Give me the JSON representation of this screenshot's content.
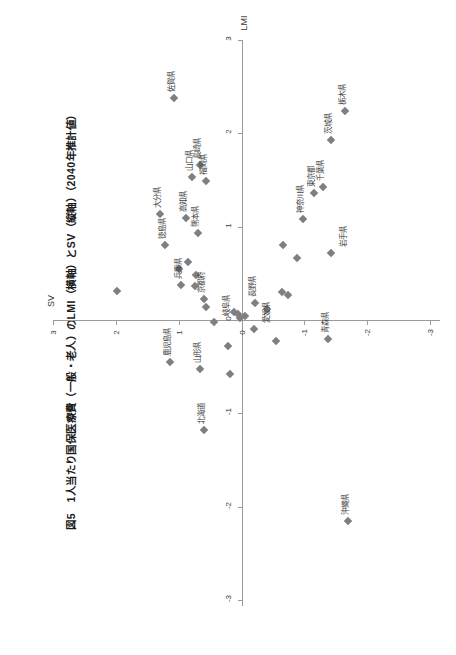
{
  "figure": {
    "title": "図5　1人当たり国保医療費（一般・老人）のLMI（横軸）とSV（縦軸）（2040年推計値）"
  },
  "chart_data": {
    "type": "scatter",
    "title": "図5　1人当たり国保医療費（一般・老人）のLMI（横軸）とSV（縦軸）（2040年推計値）",
    "xlabel": "LMI",
    "ylabel": "SV",
    "xlim": [
      -3,
      3
    ],
    "ylim": [
      -3,
      3
    ],
    "xticks": [
      3,
      2,
      1,
      0,
      -1,
      -2,
      -3
    ],
    "yticks": [
      3,
      2,
      1,
      0,
      -1,
      -2,
      -3
    ],
    "xtick_labels": [
      "3",
      "2",
      "1",
      "0",
      "-1",
      "-2",
      "-3"
    ],
    "ytick_labels": [
      "3",
      "2",
      "1",
      "0",
      "-1",
      "-2",
      "-3"
    ],
    "grid": false,
    "legend": "none",
    "marker": "diamond",
    "marker_color": "#7f7f7f",
    "points": [
      {
        "label": "佐賀県",
        "lmi": 2.38,
        "sv": 1.07,
        "label_pos": "above"
      },
      {
        "label": "栃木県",
        "lmi": 2.24,
        "sv": -1.65,
        "label_pos": "above"
      },
      {
        "label": "茨城県",
        "lmi": 1.93,
        "sv": -1.42,
        "label_pos": "above"
      },
      {
        "label": "長崎県",
        "lmi": 1.66,
        "sv": 0.66,
        "label_pos": "above"
      },
      {
        "label": "山口県",
        "lmi": 1.53,
        "sv": 0.78,
        "label_pos": "above"
      },
      {
        "label": "福岡県",
        "lmi": 1.49,
        "sv": 0.56,
        "label_pos": "above"
      },
      {
        "label": "千葉県",
        "lmi": 1.42,
        "sv": -1.3,
        "label_pos": "above"
      },
      {
        "label": "東京都",
        "lmi": 1.36,
        "sv": -1.16,
        "label_pos": "above"
      },
      {
        "label": "大分県",
        "lmi": 1.14,
        "sv": 1.3,
        "label_pos": "above"
      },
      {
        "label": "高知県",
        "lmi": 1.09,
        "sv": 0.88,
        "label_pos": "above"
      },
      {
        "label": "神奈川県",
        "lmi": 1.08,
        "sv": -0.98,
        "label_pos": "above"
      },
      {
        "label": "熊本県",
        "lmi": 0.93,
        "sv": 0.69,
        "label_pos": "above"
      },
      {
        "label": "徳島県",
        "lmi": 0.8,
        "sv": 1.21,
        "label_pos": "above"
      },
      {
        "label": "岩手県",
        "lmi": 0.72,
        "sv": -1.43,
        "label_pos": "below"
      },
      {
        "label": "",
        "lmi": 0.8,
        "sv": -0.66
      },
      {
        "label": "",
        "lmi": 0.66,
        "sv": -0.88
      },
      {
        "label": "",
        "lmi": 0.62,
        "sv": 0.85
      },
      {
        "label": "",
        "lmi": 0.55,
        "sv": 1.0
      },
      {
        "label": "",
        "lmi": 0.48,
        "sv": 0.73
      },
      {
        "label": "兵庫県",
        "lmi": 0.38,
        "sv": 0.96,
        "label_pos": "above"
      },
      {
        "label": "",
        "lmi": 0.36,
        "sv": 0.74
      },
      {
        "label": "",
        "lmi": 0.31,
        "sv": 1.98
      },
      {
        "label": "",
        "lmi": 0.3,
        "sv": -0.64
      },
      {
        "label": "",
        "lmi": 0.27,
        "sv": -0.74
      },
      {
        "label": "京都府",
        "lmi": 0.22,
        "sv": 0.6,
        "label_pos": "above"
      },
      {
        "label": "長野県",
        "lmi": 0.18,
        "sv": -0.22,
        "label_pos": "above"
      },
      {
        "label": "",
        "lmi": 0.14,
        "sv": 0.57
      },
      {
        "label": "",
        "lmi": 0.12,
        "sv": -0.4
      },
      {
        "label": "",
        "lmi": 0.09,
        "sv": 0.12
      },
      {
        "label": "",
        "lmi": 0.06,
        "sv": 0.05
      },
      {
        "label": "",
        "lmi": 0.04,
        "sv": -0.06
      },
      {
        "label": "",
        "lmi": 0.02,
        "sv": 0.02
      },
      {
        "label": "岐阜県",
        "lmi": -0.02,
        "sv": 0.43,
        "label_pos": "below"
      },
      {
        "label": "愛媛県",
        "lmi": -0.1,
        "sv": -0.2,
        "label_pos": "below"
      },
      {
        "label": "青森県",
        "lmi": -0.2,
        "sv": -1.37,
        "label_pos": "above"
      },
      {
        "label": "",
        "lmi": -0.22,
        "sv": -0.55
      },
      {
        "label": "",
        "lmi": -0.28,
        "sv": 0.22
      },
      {
        "label": "鹿児島県",
        "lmi": -0.45,
        "sv": 1.13,
        "label_pos": "above"
      },
      {
        "label": "山形県",
        "lmi": -0.52,
        "sv": 0.66,
        "label_pos": "above"
      },
      {
        "label": "",
        "lmi": -0.58,
        "sv": 0.19
      },
      {
        "label": "北海道",
        "lmi": -1.18,
        "sv": 0.6,
        "label_pos": "above"
      },
      {
        "label": "沖縄県",
        "lmi": -2.15,
        "sv": -1.69,
        "label_pos": "above"
      }
    ]
  }
}
